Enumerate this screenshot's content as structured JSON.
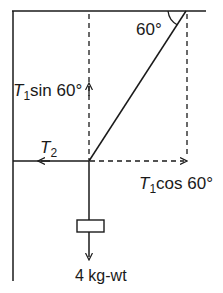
{
  "diagram": {
    "type": "free-body / tension resolution",
    "labels": {
      "angle": "60°",
      "t1_sin_T": "T",
      "t1_sin_sub": "1",
      "t1_sin_rest": "sin 60°",
      "t2_T": "T",
      "t2_sub": "2",
      "t1_cos_T": "T",
      "t1_cos_sub": "1",
      "t1_cos_rest": "cos 60°",
      "weight": "4 kg-wt"
    },
    "angle_deg": 60,
    "mass_kg_wt": 4,
    "colors": {
      "line": "#1a1a1a",
      "background": "#ffffff"
    }
  }
}
